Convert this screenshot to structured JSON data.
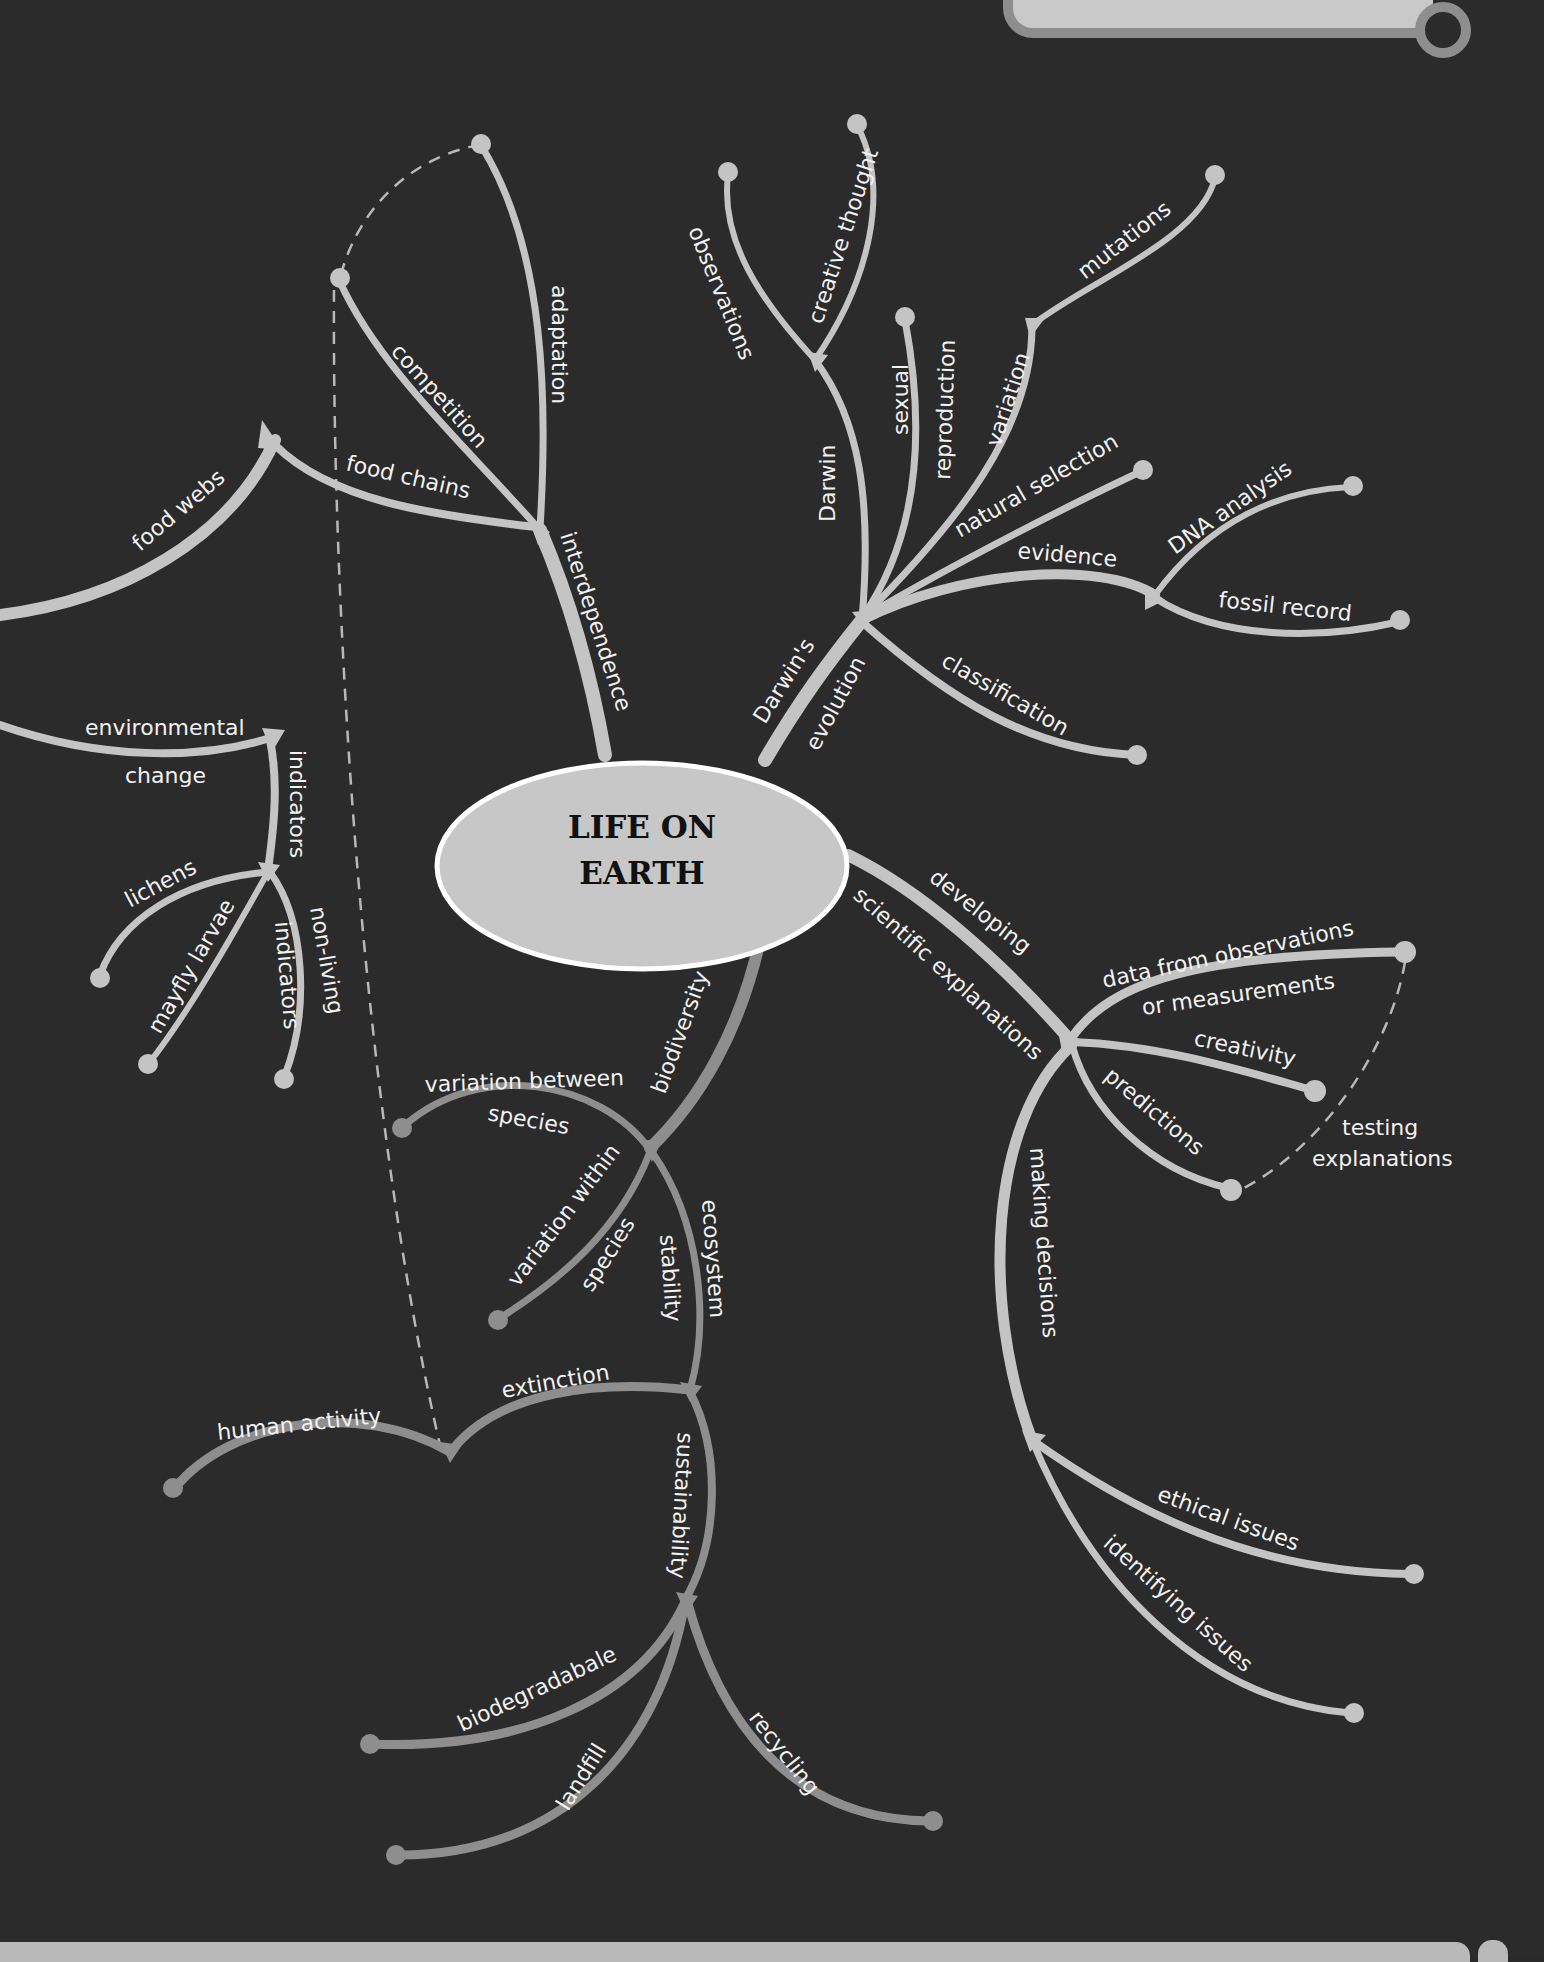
{
  "colors": {
    "background": "#2b2b2b",
    "branch_light": "#c4c4c4",
    "branch_dark": "#8e8e8e",
    "center_fill": "#c7c7c7",
    "center_stroke": "#ffffff",
    "label_text": "#f2f2f2",
    "title_text": "#111111",
    "header_tab": "#c9c9c9",
    "header_tab_edge": "#8e8e8e",
    "footer_bar": "#b9b9b9"
  },
  "center": {
    "line1": "LIFE ON",
    "line2": "EARTH"
  },
  "branches": {
    "interdependence": {
      "label": "interdependence",
      "children": {
        "adaptation": "adaptation",
        "competition": "competition",
        "food_chains": "food chains",
        "food_webs": "food webs"
      }
    },
    "darwins_evolution": {
      "label_line1": "Darwin's",
      "label_line2": "evolution",
      "children": {
        "darwin": "Darwin",
        "observations": "observations",
        "creative_thought": "creative thought",
        "sexual_reproduction_line1": "sexual",
        "sexual_reproduction_line2": "reproduction",
        "variation": "variation",
        "mutations": "mutations",
        "natural_selection": "natural selection",
        "evidence": "evidence",
        "dna_analysis": "DNA analysis",
        "fossil_record": "fossil record",
        "classification": "classification"
      }
    },
    "indicators": {
      "label": "indicators",
      "children": {
        "environmental_change_line1": "environmental",
        "environmental_change_line2": "change",
        "lichens": "lichens",
        "mayfly_larvae": "mayfly larvae",
        "non_living_indicators_line1": "non-living",
        "non_living_indicators_line2": "indicators"
      }
    },
    "developing_scientific_explanations": {
      "label_line1": "developing",
      "label_line2": "scientific explanations",
      "children": {
        "data_line1": "data from observations",
        "data_line2": "or measurements",
        "creativity": "creativity",
        "predictions": "predictions",
        "testing_line1": "testing",
        "testing_line2": "explanations",
        "making_decisions": "making decisions",
        "ethical_issues": "ethical issues",
        "identifying_issues": "identifying issues"
      }
    },
    "biodiversity": {
      "label": "biodiversity",
      "children": {
        "variation_between_line1": "variation between",
        "variation_between_line2": "species",
        "variation_within_line1": "variation within",
        "variation_within_line2": "species",
        "ecosystem_stability_line1": "ecosystem",
        "ecosystem_stability_line2": "stability",
        "extinction": "extinction",
        "human_activity": "human activity",
        "sustainability": "sustainability",
        "biodegradable": "biodegradabale",
        "landfill": "landfill",
        "recycling": "recycling"
      }
    }
  }
}
